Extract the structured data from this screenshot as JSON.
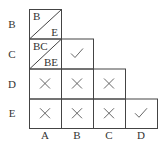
{
  "row_labels": [
    "B",
    "C",
    "D",
    "E"
  ],
  "col_labels": [
    "A",
    "B",
    "C",
    "D"
  ],
  "cells": [
    {
      "row": 0,
      "col": 0,
      "type": "split",
      "top": "B",
      "bottom": "E"
    },
    {
      "row": 1,
      "col": 0,
      "type": "split",
      "top": "BC",
      "bottom": "BE"
    },
    {
      "row": 1,
      "col": 1,
      "type": "check"
    },
    {
      "row": 2,
      "col": 0,
      "type": "cross"
    },
    {
      "row": 2,
      "col": 1,
      "type": "cross"
    },
    {
      "row": 2,
      "col": 2,
      "type": "cross"
    },
    {
      "row": 3,
      "col": 0,
      "type": "cross"
    },
    {
      "row": 3,
      "col": 1,
      "type": "cross"
    },
    {
      "row": 3,
      "col": 2,
      "type": "cross"
    },
    {
      "row": 3,
      "col": 3,
      "type": "check"
    }
  ]
}
